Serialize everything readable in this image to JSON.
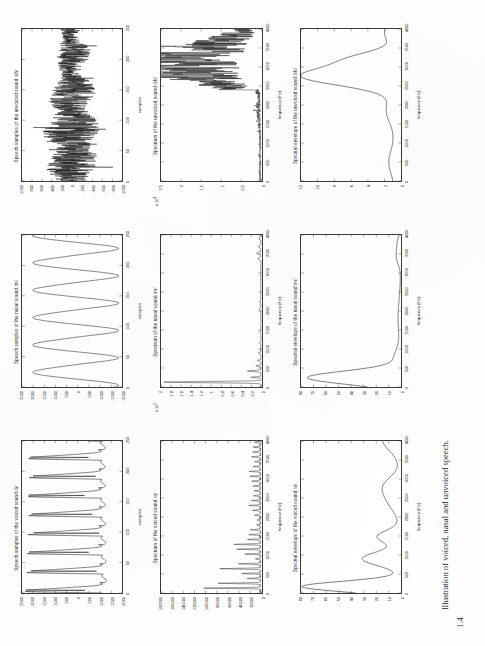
{
  "document": {
    "figure_number": "1.4",
    "caption": "Illustration of voiced, nasal and unvoiced speech."
  },
  "axis_titles": {
    "samples": "samples",
    "frequency": "frequency  (Hz)"
  },
  "panels": [
    {
      "id": "voiced-samples",
      "title": "Speech samples of the voiced sound /a/",
      "xlabel": "samples",
      "exponent": "",
      "xticks": [
        "0",
        "50",
        "100",
        "150",
        "200",
        "250"
      ],
      "yticks": [
        "-2000",
        "-1500",
        "-1000",
        "-500",
        "0",
        "500",
        "1000",
        "1500",
        "2000",
        "2500"
      ]
    },
    {
      "id": "nasal-samples",
      "title": "Speech samples of the nasal sound /m/",
      "xlabel": "samples",
      "exponent": "",
      "xticks": [
        "0",
        "50",
        "100",
        "150",
        "200",
        "250"
      ],
      "yticks": [
        "-2000",
        "-1500",
        "-1000",
        "-500",
        "0",
        "500",
        "1000",
        "1500",
        "2000",
        "2500"
      ]
    },
    {
      "id": "unvoiced-samples",
      "title": "Speech samples of the unvoiced sound /sh/",
      "xlabel": "samples",
      "exponent": "",
      "xticks": [
        "0",
        "50",
        "100",
        "150",
        "200",
        "250"
      ],
      "yticks": [
        "-1000",
        "-800",
        "-600",
        "-400",
        "-200",
        "0",
        "200",
        "400",
        "600",
        "800",
        "1000"
      ]
    },
    {
      "id": "voiced-spectrum",
      "title": "Spectrum of the voiced sound /a/",
      "xlabel": "frequency  (Hz)",
      "exponent": "",
      "xticks": [
        "0",
        "500",
        "1000",
        "1500",
        "2000",
        "2500",
        "3000",
        "3500",
        "4000"
      ],
      "yticks": [
        "0",
        "20000",
        "40000",
        "60000",
        "80000",
        "100000",
        "120000",
        "140000",
        "160000",
        "180000"
      ]
    },
    {
      "id": "nasal-spectrum",
      "title": "Spectrum of the nasal sound /m/",
      "xlabel": "frequency  (Hz)",
      "exponent": "x 10",
      "xticks": [
        "0",
        "500",
        "1000",
        "1500",
        "2000",
        "2500",
        "3000",
        "3500",
        "4000"
      ],
      "yticks": [
        "0",
        "0.2",
        "0.4",
        "0.6",
        "0.8",
        "1",
        "1.2",
        "1.4",
        "1.6",
        "1.8",
        "2"
      ]
    },
    {
      "id": "unvoiced-spectrum",
      "title": "Spectrum of the unvoiced sound /sh/",
      "xlabel": "frequency  (Hz)",
      "exponent": "x 10",
      "xticks": [
        "0",
        "500",
        "1000",
        "1500",
        "2000",
        "2500",
        "3000",
        "3500",
        "4000"
      ],
      "yticks": [
        "0",
        "0.5",
        "1",
        "1.5",
        "2",
        "2.5"
      ]
    },
    {
      "id": "voiced-envelope",
      "title": "Spectral envelope of the voiced sound /a/",
      "xlabel": "frequency  (Hz)",
      "exponent": "",
      "xticks": [
        "0",
        "500",
        "1000",
        "1500",
        "2000",
        "2500",
        "3000",
        "3500",
        "4000"
      ],
      "yticks": [
        "0",
        "10",
        "20",
        "30",
        "40",
        "50",
        "60",
        "70",
        "80"
      ]
    },
    {
      "id": "nasal-envelope",
      "title": "Spectral envelope of the nasal sound /m/",
      "xlabel": "frequency  (Hz)",
      "exponent": "",
      "xticks": [
        "0",
        "500",
        "1000",
        "1500",
        "2000",
        "2500",
        "3000",
        "3500",
        "4000"
      ],
      "yticks": [
        "0",
        "10",
        "20",
        "30",
        "40",
        "50",
        "60",
        "70",
        "80"
      ]
    },
    {
      "id": "unvoiced-envelope",
      "title": "Spectral envelope of the unvoiced sound /sh/",
      "xlabel": "frequency  (Hz)",
      "exponent": "",
      "xticks": [
        "0",
        "500",
        "1000",
        "1500",
        "2000",
        "2500",
        "3000",
        "3500",
        "4000"
      ],
      "yticks": [
        "0",
        "2",
        "4",
        "6",
        "8",
        "10",
        "12"
      ]
    }
  ],
  "chart_data": [
    {
      "type": "line",
      "id": "voiced-samples",
      "title": "Speech samples of the voiced sound /a/",
      "xlabel": "samples",
      "ylabel": "",
      "xlim": [
        0,
        250
      ],
      "ylim": [
        -2000,
        2500
      ],
      "grid": false,
      "description": "Quasi-periodic voiced waveform, ~8 glottal pulses over 250 samples (pitch period ~31 samples). Sharp positive peaks near +2300, troughs near -1300.",
      "x": [
        0,
        4,
        8,
        12,
        16,
        20,
        24,
        28,
        31,
        35,
        39,
        43,
        47,
        51,
        55,
        59,
        62,
        66,
        70,
        74,
        78,
        82,
        86,
        90,
        93,
        97,
        101,
        105,
        109,
        113,
        117,
        121,
        124,
        128,
        132,
        136,
        140,
        144,
        148,
        152,
        155,
        159,
        163,
        167,
        171,
        175,
        179,
        183,
        186,
        190,
        194,
        198,
        202,
        206,
        210,
        214,
        217,
        221,
        225,
        229,
        233,
        237,
        241,
        245,
        249
      ],
      "y": [
        -900,
        -1200,
        -1300,
        -900,
        200,
        1800,
        2350,
        1500,
        400,
        -300,
        -800,
        -1250,
        -1300,
        -700,
        600,
        2000,
        2300,
        1300,
        250,
        -400,
        -900,
        -1280,
        -1300,
        -600,
        700,
        2100,
        2250,
        1200,
        200,
        -450,
        -950,
        -1300,
        -1280,
        -550,
        800,
        2150,
        2200,
        1150,
        150,
        -500,
        -1000,
        -1300,
        -1250,
        -500,
        850,
        2200,
        2150,
        1100,
        100,
        -550,
        -1050,
        -1300,
        -1200,
        -450,
        900,
        2250,
        2100,
        1050,
        50,
        -600,
        -1100,
        -1300,
        -1150,
        -400,
        -200
      ]
    },
    {
      "type": "line",
      "id": "nasal-samples",
      "title": "Speech samples of the nasal sound /m/",
      "xlabel": "samples",
      "ylabel": "",
      "xlim": [
        0,
        250
      ],
      "ylim": [
        -2000,
        2500
      ],
      "grid": false,
      "description": "Smooth near-sinusoidal nasal waveform, about 5.5 cycles over 250 samples, amplitude +2100 / -1700.",
      "x": [
        0,
        6,
        12,
        18,
        24,
        30,
        36,
        42,
        48,
        54,
        60,
        66,
        72,
        78,
        84,
        90,
        96,
        102,
        108,
        114,
        120,
        126,
        132,
        138,
        144,
        150,
        156,
        162,
        168,
        174,
        180,
        186,
        192,
        198,
        204,
        210,
        216,
        222,
        228,
        234,
        240,
        246,
        250
      ],
      "y": [
        -1750,
        -1700,
        -1300,
        -400,
        700,
        1700,
        2050,
        1750,
        900,
        -200,
        -1100,
        -1650,
        -1750,
        -1400,
        -500,
        650,
        1650,
        2050,
        1800,
        1000,
        -100,
        -1050,
        -1600,
        -1750,
        -1450,
        -600,
        550,
        1600,
        2050,
        1850,
        1100,
        0,
        -1000,
        -1550,
        -1750,
        -1500,
        -700,
        500,
        1550,
        2050,
        1900,
        1400,
        1100
      ]
    },
    {
      "type": "line",
      "id": "unvoiced-samples",
      "title": "Speech samples of the unvoiced sound /sh/",
      "xlabel": "samples",
      "ylabel": "",
      "xlim": [
        0,
        250
      ],
      "ylim": [
        -1000,
        1000
      ],
      "grid": false,
      "description": "Noise-like unvoiced fricative waveform; dense random oscillation with slow amplitude modulation, excursions up to about +950 and -800."
    },
    {
      "type": "line",
      "id": "voiced-spectrum",
      "title": "Spectrum of the voiced sound /a/",
      "xlabel": "frequency  (Hz)",
      "ylabel": "",
      "xlim": [
        0,
        4000
      ],
      "ylim": [
        0,
        180000
      ],
      "grid": false,
      "description": "Harmonic line spectrum with strong low-frequency harmonics; tallest peak near 130 Hz reaching ~180000, secondary peaks around 650 Hz (~95000) and 1150 Hz (~60000), decaying harmonics above 1500 Hz.",
      "peaks": [
        {
          "frequency": 130,
          "amplitude": 180000
        },
        {
          "frequency": 260,
          "amplitude": 42000
        },
        {
          "frequency": 400,
          "amplitude": 22000
        },
        {
          "frequency": 650,
          "amplitude": 95000
        },
        {
          "frequency": 780,
          "amplitude": 30000
        },
        {
          "frequency": 1150,
          "amplitude": 62000
        },
        {
          "frequency": 1450,
          "amplitude": 30000
        },
        {
          "frequency": 1800,
          "amplitude": 20000
        },
        {
          "frequency": 2300,
          "amplitude": 24000
        },
        {
          "frequency": 2900,
          "amplitude": 16000
        },
        {
          "frequency": 3400,
          "amplitude": 12000
        }
      ]
    },
    {
      "type": "line",
      "id": "nasal-spectrum",
      "title": "Spectrum of the nasal sound /m/",
      "xlabel": "frequency  (Hz)",
      "ylabel": "",
      "xlim": [
        0,
        4000
      ],
      "ylim": [
        0,
        2
      ],
      "yscale_note": "x 10^5",
      "grid": false,
      "description": "Dominant very low-frequency peak near 130 Hz reaching ~1.95e5, a smaller peak near 420 Hz (~0.25e5), nearly flat negligible energy above 1000 Hz with a small bump near 3500 Hz.",
      "peaks": [
        {
          "frequency": 130,
          "amplitude": 1.95
        },
        {
          "frequency": 270,
          "amplitude": 0.22
        },
        {
          "frequency": 420,
          "amplitude": 0.27
        },
        {
          "frequency": 900,
          "amplitude": 0.06
        },
        {
          "frequency": 3500,
          "amplitude": 0.09
        }
      ]
    },
    {
      "type": "line",
      "id": "unvoiced-spectrum",
      "title": "Spectrum of the unvoiced sound /sh/",
      "xlabel": "frequency  (Hz)",
      "ylabel": "",
      "xlim": [
        0,
        4000
      ],
      "ylim": [
        0,
        2.5
      ],
      "yscale_note": "x 10^4",
      "grid": false,
      "description": "Broadband noisy spectrum, low energy below 2500 Hz, strongly rising above 2700 Hz with large jagged peaks reaching ~2.4e4 near 2900-3100 Hz and continued high energy to 4000 Hz.",
      "peaks": [
        {
          "frequency": 2900,
          "amplitude": 2.35
        },
        {
          "frequency": 3050,
          "amplitude": 1.9
        },
        {
          "frequency": 3300,
          "amplitude": 1.3
        },
        {
          "frequency": 3600,
          "amplitude": 1.1
        },
        {
          "frequency": 3900,
          "amplitude": 0.9
        }
      ]
    },
    {
      "type": "line",
      "id": "voiced-envelope",
      "title": "Spectral envelope of the voiced sound /a/",
      "xlabel": "frequency  (Hz)",
      "ylabel": "",
      "xlim": [
        0,
        4000
      ],
      "ylim": [
        0,
        80
      ],
      "grid": false,
      "description": "LPC spectral envelope of /a/ with formants: F1 near 150 Hz (~78), F2 near 900 Hz (~30), F3 near 1500 Hz (~18), a broad shoulder near 2400-2800 Hz (~10), rising again toward 4000 Hz (~14).",
      "formants": [
        {
          "frequency": 150,
          "level": 78
        },
        {
          "frequency": 900,
          "level": 30
        },
        {
          "frequency": 1500,
          "level": 18
        },
        {
          "frequency": 2500,
          "level": 10
        },
        {
          "frequency": 3900,
          "level": 14
        }
      ]
    },
    {
      "type": "line",
      "id": "nasal-envelope",
      "title": "Spectral envelope of the nasal sound /m/",
      "xlabel": "frequency  (Hz)",
      "ylabel": "",
      "xlim": [
        0,
        4000
      ],
      "ylim": [
        0,
        80
      ],
      "grid": false,
      "description": "Single dominant low-frequency resonance near 250 Hz reaching ~74, steeply decaying to near zero above 900 Hz, with a tiny bump near 3400 Hz.",
      "formants": [
        {
          "frequency": 250,
          "level": 74
        },
        {
          "frequency": 900,
          "level": 5
        },
        {
          "frequency": 3400,
          "level": 4
        }
      ]
    },
    {
      "type": "line",
      "id": "unvoiced-envelope",
      "title": "Spectral envelope of the unvoiced sound /sh/",
      "xlabel": "frequency  (Hz)",
      "ylabel": "",
      "xlim": [
        0,
        4000
      ],
      "ylim": [
        0,
        12
      ],
      "grid": false,
      "description": "Low flat envelope below 1500 Hz (~1), gradual rise from 1800 Hz, broad dominant peak near 2750 Hz reaching ~11.5, shoulder near 3200 Hz (~5.5), falling to ~2 at 4000 Hz.",
      "formants": [
        {
          "frequency": 600,
          "level": 1.0
        },
        {
          "frequency": 1800,
          "level": 1.4
        },
        {
          "frequency": 2750,
          "level": 11.5
        },
        {
          "frequency": 3200,
          "level": 5.5
        },
        {
          "frequency": 4000,
          "level": 2.0
        }
      ]
    }
  ]
}
